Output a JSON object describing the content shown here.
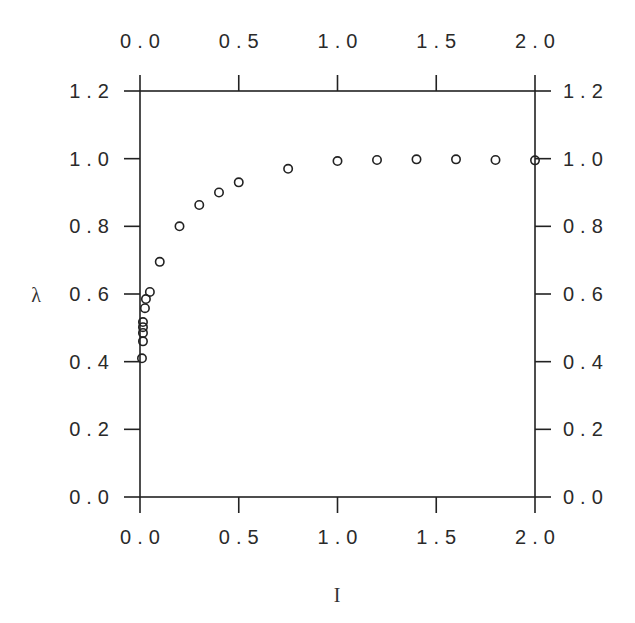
{
  "chart_data": {
    "type": "scatter",
    "title": "",
    "xlabel": "I",
    "ylabel": "λ",
    "xlim": [
      0.0,
      2.0
    ],
    "ylim": [
      0.0,
      1.2
    ],
    "x_ticks": [
      "0.0",
      "0.5",
      "1.0",
      "1.5",
      "2.0"
    ],
    "y_ticks": [
      "0.0",
      "0.2",
      "0.4",
      "0.6",
      "0.8",
      "1.0",
      "1.2"
    ],
    "grid": false,
    "legend": null,
    "marker": "open-circle",
    "series": [
      {
        "name": "λ vs I",
        "x": [
          0.01,
          0.015,
          0.015,
          0.015,
          0.015,
          0.025,
          0.03,
          0.05,
          0.1,
          0.2,
          0.3,
          0.4,
          0.5,
          0.75,
          1.0,
          1.2,
          1.4,
          1.6,
          1.8,
          2.0
        ],
        "y": [
          0.41,
          0.46,
          0.485,
          0.502,
          0.517,
          0.558,
          0.585,
          0.606,
          0.695,
          0.8,
          0.863,
          0.9,
          0.93,
          0.97,
          0.993,
          0.996,
          0.998,
          0.998,
          0.996,
          0.995
        ]
      }
    ]
  },
  "layout": {
    "plot": {
      "left": 140,
      "top": 91,
      "right": 535,
      "bottom": 497
    },
    "tick_length": 16,
    "line_color": "#222222",
    "marker_radius": 4.2
  }
}
